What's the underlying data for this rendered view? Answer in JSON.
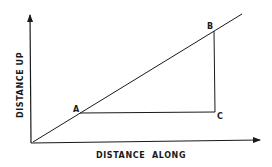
{
  "diagram": {
    "type": "slope-triangle",
    "colors": {
      "ink": "#1a1a1a",
      "background": "#ffffff"
    },
    "axes": {
      "x_label": "DISTANCE  ALONG",
      "y_label": "DISTANCE UP"
    },
    "points": {
      "A": {
        "label": "A"
      },
      "B": {
        "label": "B"
      },
      "C": {
        "label": "C"
      }
    }
  }
}
